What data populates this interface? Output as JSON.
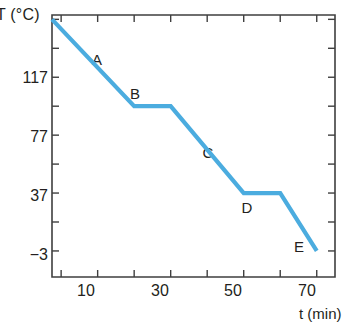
{
  "chart_data": {
    "type": "line",
    "title": "",
    "subtitle": "",
    "xlabel": "t (min)",
    "ylabel": "T (°C)",
    "xlim": [
      -2.5,
      75
    ],
    "ylim": [
      -21,
      160
    ],
    "grid": false,
    "legend": "none",
    "x_ticks": [
      0,
      10,
      20,
      30,
      40,
      50,
      60,
      70
    ],
    "x_tick_labels": [
      "",
      "10",
      "",
      "30",
      "",
      "50",
      "",
      "70"
    ],
    "y_ticks": [
      -3,
      17,
      37,
      57,
      77,
      97,
      117,
      137,
      157
    ],
    "y_tick_labels": [
      "-3",
      "",
      "37",
      "",
      "77",
      "",
      "117",
      "",
      ""
    ],
    "series": [
      {
        "name": "cooling curve",
        "color": "#4bacdf",
        "x": [
          -2.5,
          20,
          30,
          50,
          60,
          70
        ],
        "y": [
          157,
          97,
          97,
          37,
          37,
          -3
        ]
      }
    ],
    "annotations": [
      {
        "text": "A",
        "x": 11,
        "y": 131
      },
      {
        "text": "B",
        "x": 25,
        "y": 113
      },
      {
        "text": "C",
        "x": 40,
        "y": 76
      },
      {
        "text": "D",
        "x": 55,
        "y": 53
      },
      {
        "text": "E",
        "x": 68.5,
        "y": 23
      }
    ]
  },
  "axis": {
    "y_title": "T (°C)",
    "x_title": "t (min)",
    "y_labels": [
      {
        "value": "117"
      },
      {
        "value": "77"
      },
      {
        "value": "37"
      },
      {
        "value": "−3"
      }
    ],
    "x_labels": [
      {
        "value": "10"
      },
      {
        "value": "30"
      },
      {
        "value": "50"
      },
      {
        "value": "70"
      }
    ]
  },
  "colors": {
    "line": "#4bacdf",
    "axis": "#3f3f3f",
    "text": "#231f20",
    "background": "#ffffff"
  }
}
